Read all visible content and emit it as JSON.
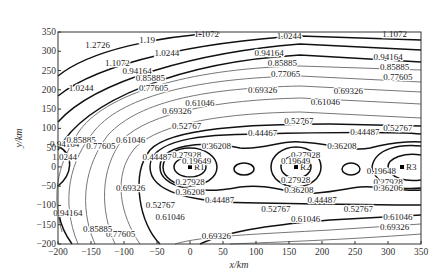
{
  "chart_data": {
    "type": "contour",
    "title": "",
    "xlabel": "x/km",
    "ylabel": "y/km",
    "xlim": [
      -200,
      350
    ],
    "ylim": [
      -200,
      350
    ],
    "xticks": [
      -200,
      -150,
      -100,
      -50,
      0,
      50,
      100,
      150,
      200,
      250,
      300,
      350
    ],
    "yticks": [
      -200,
      -150,
      -100,
      -50,
      0,
      50,
      100,
      150,
      200,
      250,
      300,
      350
    ],
    "grid": false,
    "legend": null,
    "contour_levels": [
      0.19649,
      0.27928,
      0.36208,
      0.44487,
      0.52767,
      0.61046,
      0.69326,
      0.77605,
      0.85885,
      0.94164,
      1.0244,
      1.1072,
      1.19,
      1.2726
    ],
    "points": [
      {
        "label": "R1",
        "x": 0,
        "y": 0
      },
      {
        "label": "R2",
        "x": 160,
        "y": 0
      },
      {
        "label": "R3",
        "x": 320,
        "y": 0
      }
    ],
    "contour_labels": [
      {
        "text": "1.2726",
        "x": -140,
        "y": 315
      },
      {
        "text": "1.19",
        "x": -65,
        "y": 330
      },
      {
        "text": "1.1072",
        "x": -110,
        "y": 270
      },
      {
        "text": "1.1072",
        "x": 25,
        "y": 345
      },
      {
        "text": "1.1072",
        "x": 310,
        "y": 345
      },
      {
        "text": "1.0244",
        "x": -165,
        "y": 205
      },
      {
        "text": "1.0244",
        "x": -35,
        "y": 295
      },
      {
        "text": "1.0244",
        "x": 150,
        "y": 340
      },
      {
        "text": "0.94164",
        "x": -80,
        "y": 250
      },
      {
        "text": "0.94164",
        "x": 120,
        "y": 295
      },
      {
        "text": "0.94164",
        "x": 300,
        "y": 285
      },
      {
        "text": "0.85885",
        "x": -60,
        "y": 230
      },
      {
        "text": "0.85885",
        "x": 140,
        "y": 270
      },
      {
        "text": "0.85885",
        "x": 310,
        "y": 258
      },
      {
        "text": "0.77605",
        "x": -55,
        "y": 205
      },
      {
        "text": "0.77065",
        "x": 145,
        "y": 240
      },
      {
        "text": "0.77605",
        "x": 315,
        "y": 232
      },
      {
        "text": "0.69326",
        "x": -20,
        "y": 145
      },
      {
        "text": "0.69326",
        "x": 110,
        "y": 200
      },
      {
        "text": "0.69326",
        "x": 240,
        "y": 198
      },
      {
        "text": "0.61046",
        "x": 15,
        "y": 165
      },
      {
        "text": "0.61046",
        "x": 205,
        "y": 168
      },
      {
        "text": "0.52767",
        "x": -5,
        "y": 105
      },
      {
        "text": "0.52767",
        "x": 165,
        "y": 120
      },
      {
        "text": "0.52767",
        "x": 315,
        "y": 100
      },
      {
        "text": "0.44467",
        "x": 110,
        "y": 88
      },
      {
        "text": "0.44487",
        "x": 265,
        "y": 90
      },
      {
        "text": "0.36208",
        "x": 40,
        "y": 55
      },
      {
        "text": "0.36208",
        "x": 230,
        "y": 55
      },
      {
        "text": "0.27928",
        "x": -5,
        "y": 30
      },
      {
        "text": "0.27928",
        "x": 175,
        "y": 30
      },
      {
        "text": "0.19649",
        "x": 10,
        "y": 15
      },
      {
        "text": "0.19649",
        "x": 160,
        "y": 15
      },
      {
        "text": "0.19648",
        "x": 290,
        "y": -10
      },
      {
        "text": "0.27928",
        "x": 0,
        "y": -40
      },
      {
        "text": "0.27928",
        "x": 160,
        "y": -35
      },
      {
        "text": "0.27928",
        "x": 300,
        "y": -40
      },
      {
        "text": "0.36208",
        "x": 0,
        "y": -65
      },
      {
        "text": "0.36208",
        "x": 165,
        "y": -60
      },
      {
        "text": "0.36206",
        "x": 300,
        "y": -55
      },
      {
        "text": "0.44487",
        "x": 45,
        "y": -85
      },
      {
        "text": "0.44487",
        "x": 200,
        "y": -85
      },
      {
        "text": "0.52767",
        "x": -45,
        "y": -100
      },
      {
        "text": "0.52767",
        "x": 130,
        "y": -110
      },
      {
        "text": "0.52767",
        "x": 255,
        "y": -110
      },
      {
        "text": "0.61046",
        "x": -30,
        "y": -130
      },
      {
        "text": "0.61046",
        "x": 175,
        "y": -135
      },
      {
        "text": "0.61046",
        "x": 315,
        "y": -130
      },
      {
        "text": "0.69326",
        "x": 40,
        "y": -180
      },
      {
        "text": "0.69326",
        "x": 310,
        "y": -155
      },
      {
        "text": "0.77605",
        "x": -105,
        "y": -175
      },
      {
        "text": "0.85885",
        "x": -140,
        "y": -160
      },
      {
        "text": "0.94164",
        "x": -185,
        "y": -120
      },
      {
        "text": "0.94164",
        "x": -190,
        "y": 60
      },
      {
        "text": "1.0244",
        "x": -190,
        "y": 25
      },
      {
        "text": "0.85885",
        "x": -165,
        "y": 70
      },
      {
        "text": "0.77605",
        "x": -135,
        "y": 55
      },
      {
        "text": "0.69326",
        "x": -90,
        "y": -55
      },
      {
        "text": "0.61046",
        "x": -90,
        "y": 70
      },
      {
        "text": "0.44487",
        "x": -50,
        "y": 25
      }
    ]
  }
}
